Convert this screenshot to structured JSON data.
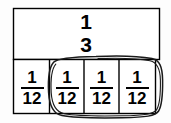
{
  "figure": {
    "colors": {
      "background": "#fdfdfd",
      "line": "#000000",
      "text": "#000000",
      "annotation": "#1a1a1a"
    },
    "top_row": {
      "label": "1/3",
      "numerator": "1",
      "denominator": "3"
    },
    "bottom_row": {
      "cells": [
        {
          "label": "1/12",
          "numerator": "1",
          "denominator": "12",
          "circled": "false"
        },
        {
          "label": "1/12",
          "numerator": "1",
          "denominator": "12",
          "circled": "true"
        },
        {
          "label": "1/12",
          "numerator": "1",
          "denominator": "12",
          "circled": "true"
        },
        {
          "label": "1/12",
          "numerator": "1",
          "denominator": "12",
          "circled": "true"
        }
      ]
    },
    "annotation": {
      "shape": "hand-drawn-oval",
      "encircles_cells": "3"
    }
  }
}
